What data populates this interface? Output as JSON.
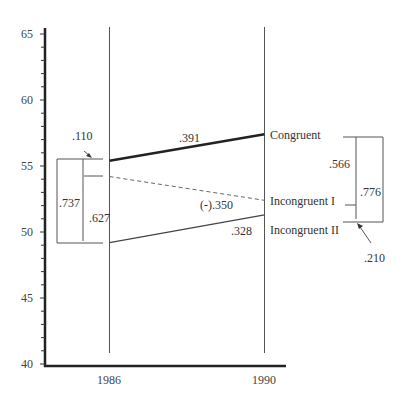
{
  "chart_data": {
    "type": "line",
    "title": "",
    "xlabel": "",
    "ylabel": "",
    "x": [
      "1986",
      "1990"
    ],
    "ylim": [
      40,
      65
    ],
    "yticks": [
      40,
      45,
      50,
      55,
      60,
      65
    ],
    "yminor_step": 1,
    "grid": false,
    "series": [
      {
        "name": "Congruent",
        "values": [
          55.4,
          57.4
        ],
        "style": "solid-thick",
        "slope_label": ".391"
      },
      {
        "name": "Incongruent I",
        "values": [
          54.2,
          52.4
        ],
        "style": "dashed",
        "slope_label": "(-).350"
      },
      {
        "name": "Incongruent II",
        "values": [
          49.2,
          51.3
        ],
        "style": "solid-thin",
        "slope_label": ".328"
      }
    ],
    "annotations": {
      "left_bracket": {
        "year": "1986",
        "outer": ".737",
        "inner": ".627",
        "top_gap": ".110"
      },
      "right_bracket": {
        "year": "1990",
        "outer": ".776",
        "inner": ".566",
        "bottom_gap": ".210"
      }
    }
  }
}
